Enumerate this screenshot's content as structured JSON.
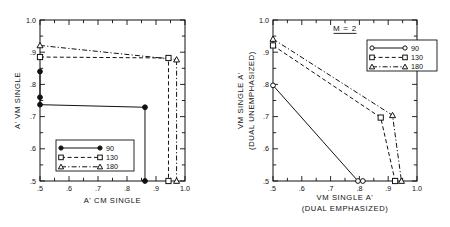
{
  "figure": {
    "background": "#ffffff",
    "ink": "#111111",
    "width": 450,
    "height": 227
  },
  "chart_data": [
    {
      "id": "left-panel",
      "type": "line",
      "title": "",
      "xlabel": "A' CM SINGLE",
      "ylabel": "A' VM SINGLE",
      "xlim": [
        0.5,
        1.0
      ],
      "ylim": [
        0.5,
        1.0
      ],
      "xticks": [
        0.5,
        0.55,
        0.6,
        0.65,
        0.7,
        0.75,
        0.8,
        0.85,
        0.9,
        0.95,
        1.0
      ],
      "yticks": [
        0.5,
        0.55,
        0.6,
        0.65,
        0.7,
        0.75,
        0.8,
        0.85,
        0.9,
        0.95,
        1.0
      ],
      "xticklabels": [
        ".5",
        ".6",
        ".7",
        ".8",
        ".9",
        "1.0"
      ],
      "xticklabel_values": [
        0.5,
        0.6,
        0.7,
        0.8,
        0.9,
        1.0
      ],
      "yticklabels": [
        ".5",
        ".6",
        ".7",
        ".8",
        ".9",
        "1.0"
      ],
      "yticklabel_values": [
        0.5,
        0.6,
        0.7,
        0.8,
        0.9,
        1.0
      ],
      "grid": false,
      "legend_position": "lower-left",
      "series": [
        {
          "name": "90",
          "marker": "filled-circle",
          "linestyle": "solid",
          "points": [
            [
              0.5,
              0.84
            ],
            [
              0.5,
              0.76
            ],
            [
              0.5,
              0.737
            ],
            [
              0.862,
              0.729
            ],
            [
              0.862,
              0.5
            ]
          ]
        },
        {
          "name": "130",
          "marker": "open-square",
          "linestyle": "dashed",
          "points": [
            [
              0.5,
              0.885
            ],
            [
              0.943,
              0.882
            ],
            [
              0.943,
              0.5
            ]
          ]
        },
        {
          "name": "180",
          "marker": "open-triangle",
          "linestyle": "dashdot",
          "points": [
            [
              0.5,
              0.921
            ],
            [
              0.971,
              0.877
            ],
            [
              0.971,
              0.5
            ]
          ]
        }
      ]
    },
    {
      "id": "right-panel",
      "type": "line",
      "title": "M = 2",
      "xlabel": "VM SINGLE A'",
      "xlabel_sub": "(DUAL EMPHASIZED)",
      "ylabel": "VM SINGLE A'",
      "ylabel_sub": "(DUAL UNEMPHASIZED)",
      "xlim": [
        0.5,
        1.0
      ],
      "ylim": [
        0.5,
        1.0
      ],
      "xticks": [
        0.5,
        0.55,
        0.6,
        0.65,
        0.7,
        0.75,
        0.8,
        0.85,
        0.9,
        0.95,
        1.0
      ],
      "yticks": [
        0.5,
        0.55,
        0.6,
        0.65,
        0.7,
        0.75,
        0.8,
        0.85,
        0.9,
        0.95,
        1.0
      ],
      "xticklabels": [
        ".5",
        ".6",
        ".7",
        ".8",
        ".9",
        "1.0"
      ],
      "xticklabel_values": [
        0.5,
        0.6,
        0.7,
        0.8,
        0.9,
        1.0
      ],
      "yticklabels": [
        ".5",
        ".6",
        ".7",
        ".8",
        ".9",
        "1.0"
      ],
      "yticklabel_values": [
        0.5,
        0.6,
        0.7,
        0.8,
        0.9,
        1.0
      ],
      "grid": false,
      "legend_position": "upper-right",
      "series": [
        {
          "name": "90",
          "marker": "open-circle",
          "linestyle": "solid",
          "points": [
            [
              0.5,
              0.797
            ],
            [
              0.795,
              0.5
            ],
            [
              0.812,
              0.5
            ]
          ]
        },
        {
          "name": "130",
          "marker": "open-square",
          "linestyle": "dashed",
          "points": [
            [
              0.5,
              0.921
            ],
            [
              0.874,
              0.697
            ],
            [
              0.924,
              0.5
            ]
          ]
        },
        {
          "name": "180",
          "marker": "open-triangle",
          "linestyle": "dashdot",
          "points": [
            [
              0.5,
              0.941
            ],
            [
              0.915,
              0.704
            ],
            [
              0.946,
              0.5
            ]
          ]
        }
      ]
    }
  ],
  "legends": {
    "left": [
      {
        "label": "90",
        "marker": "filled-circle",
        "linestyle": "solid"
      },
      {
        "label": "130",
        "marker": "open-square",
        "linestyle": "dashed"
      },
      {
        "label": "180",
        "marker": "open-triangle",
        "linestyle": "dashdot"
      }
    ],
    "right": [
      {
        "label": "90",
        "marker": "open-circle",
        "linestyle": "solid"
      },
      {
        "label": "130",
        "marker": "open-square",
        "linestyle": "dashed"
      },
      {
        "label": "180",
        "marker": "open-triangle",
        "linestyle": "dashdot"
      }
    ]
  }
}
